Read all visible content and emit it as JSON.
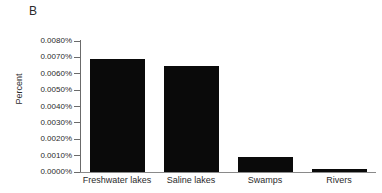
{
  "figure": {
    "panel_label": "B"
  },
  "chart_data": {
    "type": "bar",
    "title": "",
    "subtitle": "",
    "xlabel": "",
    "ylabel": "Percent",
    "categories": [
      "Freshwater lakes",
      "Saline lakes",
      "Swamps",
      "Rivers"
    ],
    "values": [
      0.0069,
      0.00645,
      0.00092,
      0.0002
    ],
    "value_unit": "percent",
    "ylim": [
      0.0,
      0.008
    ],
    "ytick_values": [
      0.0,
      0.001,
      0.002,
      0.003,
      0.004,
      0.005,
      0.006,
      0.007,
      0.008
    ],
    "ytick_labels": [
      "0.0000%",
      "0.0010%",
      "0.0020%",
      "0.0030%",
      "0.0040%",
      "0.0050%",
      "0.0060%",
      "0.0070%",
      "0.0080%"
    ],
    "grid": false,
    "legend": null,
    "bar_color": "#0a0a0a",
    "axis_color": "#6b6b6b",
    "annotations": [
      "B"
    ]
  }
}
